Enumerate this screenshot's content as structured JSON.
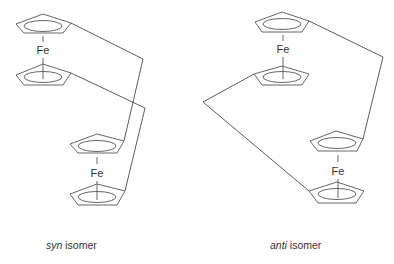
{
  "figure": {
    "panels": [
      {
        "id": "syn",
        "caption_italic": "syn",
        "caption_rest": " isomer",
        "metal_labels": [
          "Fe",
          "Fe"
        ]
      },
      {
        "id": "anti",
        "caption_italic": "anti",
        "caption_rest": " isomer",
        "metal_labels": [
          "Fe",
          "Fe"
        ]
      }
    ],
    "colors": {
      "background": "#ffffff",
      "line": "#555555",
      "text": "#333333"
    }
  }
}
